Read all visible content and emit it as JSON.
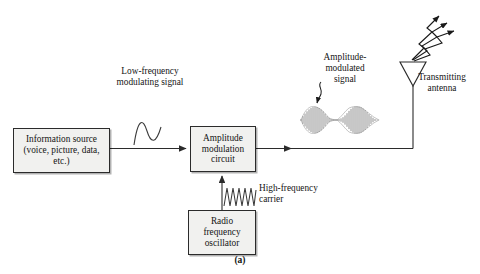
{
  "figure": {
    "caption": "(a)",
    "blocks": [
      {
        "id": "information-source",
        "text": "Information source\n(voice, picture, data,\netc.)"
      },
      {
        "id": "amplitude-modulation-circuit",
        "text": "Amplitude\nmodulation\ncircuit"
      },
      {
        "id": "radio-frequency-oscillator",
        "text": "Radio\nfrequency\noscillator"
      }
    ],
    "labels": {
      "modulating_signal": "Low-frequency\nmodulating signal",
      "am_signal": "Amplitude-\nmodulated\nsignal",
      "carrier": "High-frequency\ncarrier",
      "antenna": "Transmitting\nantenna"
    },
    "waveforms": [
      {
        "id": "modulating-sine",
        "type": "sine",
        "cycles": 1,
        "description": "low-frequency modulating sine wave"
      },
      {
        "id": "carrier-sine",
        "type": "sine",
        "cycles": 8,
        "description": "high-frequency carrier sine wave"
      },
      {
        "id": "am-envelope",
        "type": "amplitude-modulated",
        "lobes": 2,
        "description": "amplitude modulated carrier with two envelope lobes"
      }
    ],
    "antenna": {
      "shape": "triangle",
      "radiation_arrows": 3
    },
    "colors": {
      "line": "#2b2b2b",
      "block_fill": "#f1f1ef",
      "text": "#141414",
      "background": "#ffffff"
    }
  }
}
